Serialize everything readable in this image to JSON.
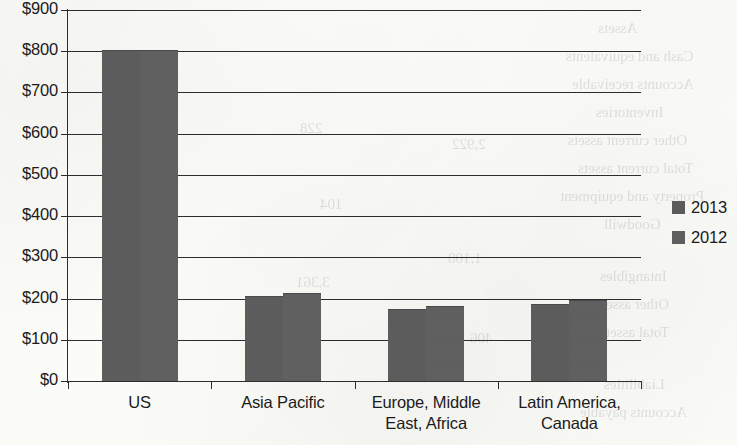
{
  "chart_data": {
    "type": "bar",
    "title": "",
    "xlabel": "",
    "ylabel": "",
    "grid": true,
    "legend_position": "right",
    "ylim": [
      0,
      900
    ],
    "ytick_labels": [
      "$900",
      "$800",
      "$700",
      "$600",
      "$500",
      "$400",
      "$300",
      "$200",
      "$100",
      "$0"
    ],
    "ytick_values": [
      900,
      800,
      700,
      600,
      500,
      400,
      300,
      200,
      100,
      0
    ],
    "categories": [
      "US",
      "Asia Pacific",
      "Europe, Middle East, Africa",
      "Latin America, Canada"
    ],
    "category_lines": [
      [
        "US"
      ],
      [
        "Asia Pacific"
      ],
      [
        "Europe, Middle",
        "East, Africa"
      ],
      [
        "Latin America,",
        "Canada"
      ]
    ],
    "series": [
      {
        "name": "2013",
        "color": "#595959",
        "values": [
          800,
          205,
          172,
          185
        ]
      },
      {
        "name": "2012",
        "color": "#5d5d5d",
        "values": [
          800,
          210,
          180,
          195
        ]
      }
    ]
  },
  "legend": {
    "items": [
      {
        "label": "2013"
      },
      {
        "label": "2012"
      }
    ]
  },
  "showthrough": {
    "lines": [
      "Assets",
      "Cash and equivalents",
      "Accounts receivable",
      "Inventories",
      "Other current assets",
      "Total current assets",
      "Property and equipment",
      "Goodwill",
      "Intangibles",
      "Other assets",
      "Total assets",
      "Liabilities",
      "Accounts payable",
      "Accrued expenses"
    ],
    "numbers": [
      "1,125",
      "330",
      "157",
      "102",
      "1,714",
      "263",
      "912",
      "140",
      "228",
      "104",
      "3,361",
      "2,922",
      "1,108",
      "406"
    ]
  }
}
